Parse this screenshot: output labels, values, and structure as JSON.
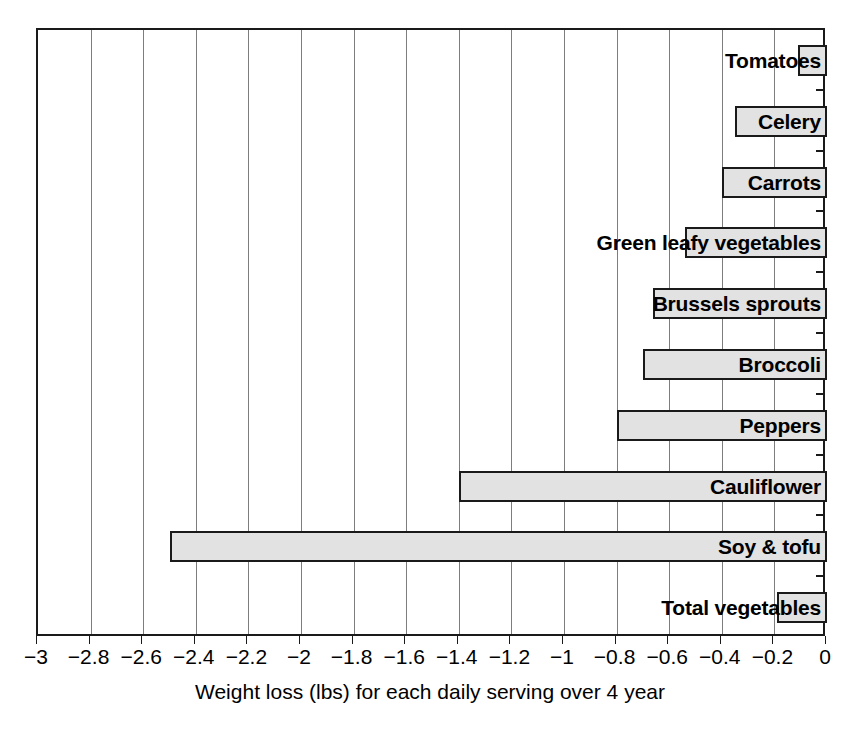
{
  "chart_data": {
    "type": "bar",
    "orientation": "horizontal",
    "title": "",
    "xlabel": "Weight loss (lbs) for each daily serving over 4 year",
    "ylabel": "",
    "xlim": [
      -3,
      0
    ],
    "ylim": [
      0,
      10
    ],
    "grid": true,
    "legend": null,
    "xticks": [
      -3,
      -2.8,
      -2.6,
      -2.4,
      -2.2,
      -2,
      -1.8,
      -1.6,
      -1.4,
      -1.2,
      -1,
      -0.8,
      -0.6,
      -0.4,
      -0.2,
      0
    ],
    "xtick_labels": [
      "−3",
      "−2.8",
      "−2.6",
      "−2.4",
      "−2.2",
      "−2",
      "−1.8",
      "−1.6",
      "−1.4",
      "−1.2",
      "−1",
      "−0.8",
      "−0.6",
      "−0.4",
      "−0.2",
      "0"
    ],
    "categories": [
      "Tomatoes",
      "Celery",
      "Carrots",
      "Green leafy vegetables",
      "Brussels sprouts",
      "Broccoli",
      "Peppers",
      "Cauliflower",
      "Soy & tofu",
      "Total vegetables"
    ],
    "values": [
      -0.11,
      -0.35,
      -0.4,
      -0.54,
      -0.66,
      -0.7,
      -0.8,
      -1.4,
      -2.5,
      -0.19
    ],
    "bar_fill_color": "#e2e2e2",
    "bar_edge_color": "#1a1a1a",
    "grid_color": "#7d7d7d",
    "axis_color": "#1a1a1a"
  },
  "axis": {
    "x_title": "Weight loss (lbs) for each daily serving over 4 year"
  }
}
